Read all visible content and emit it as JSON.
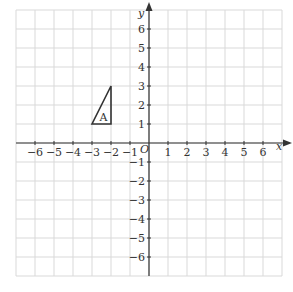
{
  "diagram": {
    "type": "coordinate-grid",
    "x_axis": {
      "label": "x",
      "min": -7,
      "max": 7,
      "ticks": [
        -6,
        -5,
        -4,
        -3,
        -2,
        -1,
        1,
        2,
        3,
        4,
        5,
        6
      ]
    },
    "y_axis": {
      "label": "y",
      "min": -7,
      "max": 7,
      "ticks": [
        -6,
        -5,
        -4,
        -3,
        -2,
        -1,
        1,
        2,
        3,
        4,
        5,
        6
      ]
    },
    "origin_label": "O",
    "shapes": [
      {
        "name": "A",
        "label": "A",
        "vertices": [
          [
            -3,
            1
          ],
          [
            -2,
            1
          ],
          [
            -2,
            3
          ]
        ]
      }
    ],
    "colors": {
      "grid": "#d9d9d9",
      "axis": "#333333",
      "shape": "#333333"
    }
  },
  "labels": {
    "x": "x",
    "y": "y",
    "origin": "O",
    "shapeA": "A"
  }
}
